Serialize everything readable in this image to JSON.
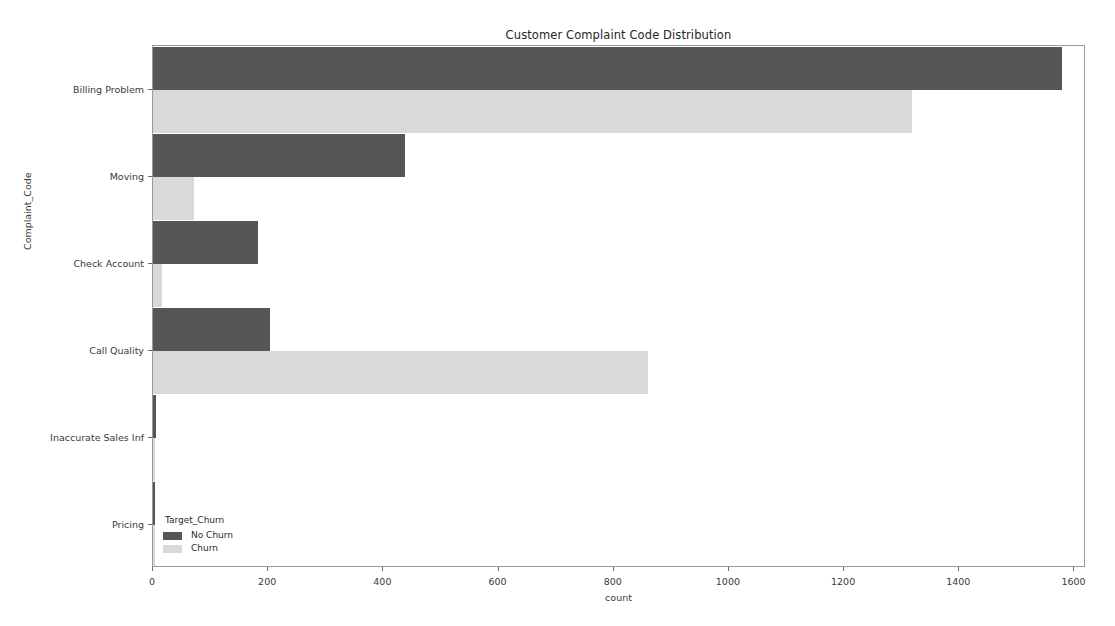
{
  "chart_data": {
    "type": "bar",
    "orientation": "horizontal",
    "grouped": true,
    "title": "Customer Complaint Code Distribution",
    "xlabel": "count",
    "ylabel": "Complaint_Code",
    "categories": [
      "Billing Problem",
      "Moving",
      "Check Account",
      "Call Quality",
      "Inaccurate Sales Inf",
      "Pricing"
    ],
    "series": [
      {
        "name": "No Churn",
        "color": "#565656",
        "values": [
          1578,
          437,
          182,
          203,
          5,
          2
        ]
      },
      {
        "name": "Churn",
        "color": "#d9d9d9",
        "values": [
          1318,
          72,
          16,
          860,
          3,
          1
        ]
      }
    ],
    "legend_title": "Target_Churn",
    "legend_position": "lower left",
    "xlim": [
      0,
      1620
    ],
    "ylim_categories": 6,
    "xticks": [
      0,
      200,
      400,
      600,
      800,
      1000,
      1200,
      1400,
      1600
    ],
    "xtick_labels": [
      "0",
      "200",
      "400",
      "600",
      "800",
      "1000",
      "1200",
      "1400",
      "1600"
    ],
    "grid": false,
    "background_color": "#ffffff",
    "axes_edge_color": "#9a9a9a"
  },
  "legend": {
    "title": "Target_Churn",
    "entries": [
      {
        "label": "No Churn",
        "color": "#565656"
      },
      {
        "label": "Churn",
        "color": "#d9d9d9"
      }
    ]
  }
}
